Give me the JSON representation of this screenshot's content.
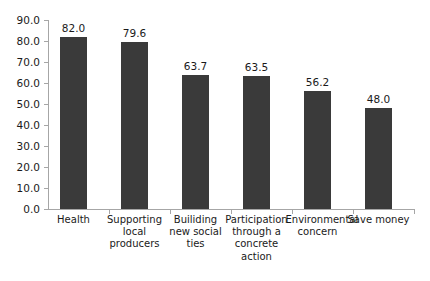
{
  "chart_data": {
    "type": "bar",
    "title": "",
    "subtitle": "",
    "xlabel": "",
    "ylabel": "",
    "ylim": [
      0,
      90
    ],
    "grid": false,
    "legend": "none",
    "bar_color": "#3a3a3a",
    "axis_color": "#a6a6a6",
    "background": "#ffffff",
    "categories": [
      "Health",
      "Supporting local producers",
      "Builiding new social ties",
      "Participation through a concrete action",
      "Environmental concern",
      "Save money"
    ],
    "values": [
      82.0,
      79.6,
      63.7,
      63.5,
      56.2,
      48.0
    ],
    "value_labels": [
      "82.0",
      "79.6",
      "63.7",
      "63.5",
      "56.2",
      "48.0"
    ],
    "ytick_labels": [
      "90.0",
      "80.0",
      "70.0",
      "60.0",
      "50.0",
      "40.0",
      "30.0",
      "20.0",
      "10.0",
      "0.0"
    ],
    "ytick_values": [
      90,
      80,
      70,
      60,
      50,
      40,
      30,
      20,
      10,
      0
    ]
  }
}
